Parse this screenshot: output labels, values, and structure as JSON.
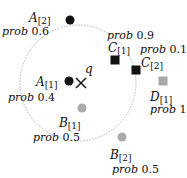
{
  "query": {
    "label": "q",
    "x": 81,
    "y": 83
  },
  "range_circle": {
    "cx": 78,
    "cy": 83,
    "r": 58,
    "stroke": "#b0b0b0"
  },
  "colors": {
    "black": "#111111",
    "gray": "#aaaaaa"
  },
  "prob_word": "prob",
  "objects": [
    {
      "id": "A2",
      "base": "A",
      "index": "[2]",
      "prob": "0.6",
      "shape": "circle",
      "color": "#111111",
      "x": 70,
      "y": 20
    },
    {
      "id": "A1",
      "base": "A",
      "index": "[1]",
      "prob": "0.4",
      "shape": "circle",
      "color": "#111111",
      "x": 69,
      "y": 81
    },
    {
      "id": "B1",
      "base": "B",
      "index": "[1]",
      "prob": "0.5",
      "shape": "circle",
      "color": "#aaaaaa",
      "x": 82,
      "y": 108
    },
    {
      "id": "B2",
      "base": "B",
      "index": "[2]",
      "prob": "0.5",
      "shape": "circle",
      "color": "#aaaaaa",
      "x": 122,
      "y": 137
    },
    {
      "id": "C1",
      "base": "C",
      "index": "[1]",
      "prob": "0.9",
      "shape": "square",
      "color": "#111111",
      "x": 115,
      "y": 60
    },
    {
      "id": "C2",
      "base": "C",
      "index": "[2]",
      "prob": "0.1",
      "shape": "square",
      "color": "#111111",
      "x": 136,
      "y": 70
    },
    {
      "id": "D1",
      "base": "D",
      "index": "[1]",
      "prob": "1",
      "shape": "square",
      "color": "#aaaaaa",
      "x": 163,
      "y": 81
    }
  ],
  "labels": {
    "A2": {
      "name_x": 29,
      "name_y": 12,
      "prob_x": 2,
      "prob_y": 26
    },
    "A1": {
      "name_x": 36,
      "name_y": 76,
      "prob_x": 8,
      "prob_y": 92
    },
    "B1": {
      "name_x": 59,
      "name_y": 117,
      "prob_x": 33,
      "prob_y": 132
    },
    "B2": {
      "name_x": 110,
      "name_y": 149,
      "prob_x": 112,
      "prob_y": 164
    },
    "C1": {
      "name_x": 108,
      "name_y": 42,
      "prob_x": 107,
      "prob_y": 30
    },
    "C2": {
      "name_x": 141,
      "name_y": 57,
      "prob_x": 140,
      "prob_y": 44
    },
    "D1": {
      "name_x": 150,
      "name_y": 91,
      "prob_x": 150,
      "prob_y": 104
    }
  }
}
